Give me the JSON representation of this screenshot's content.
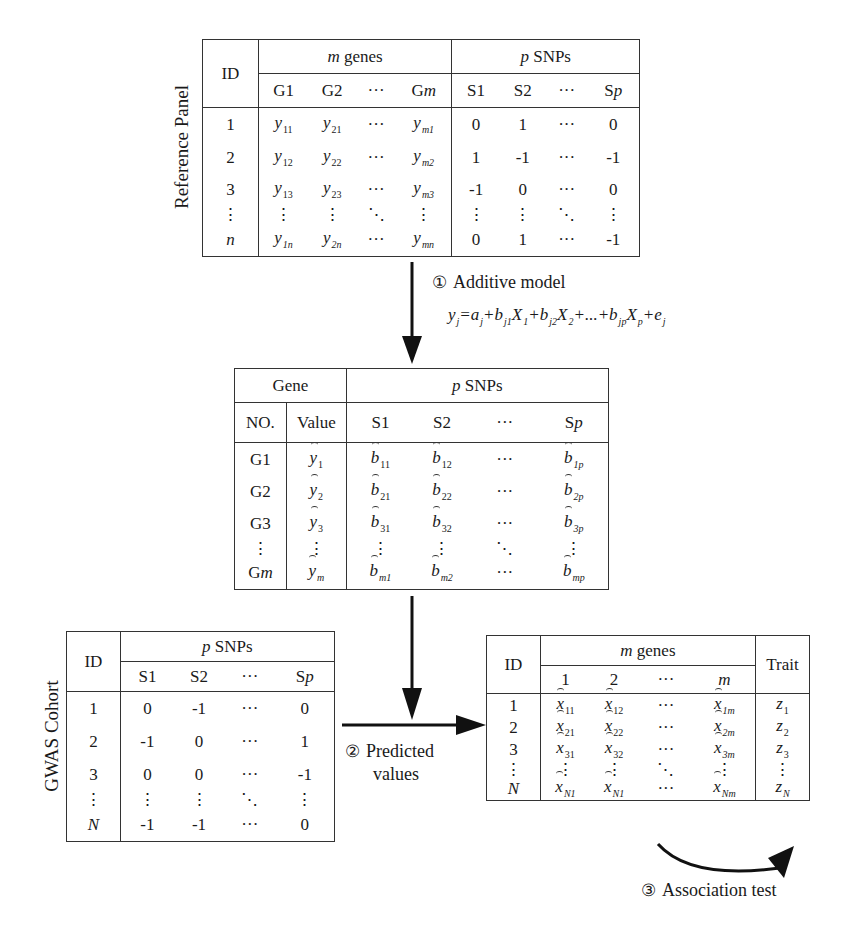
{
  "reference_panel": {
    "side_label": "Reference Panel",
    "id_header": "ID",
    "genes_group": {
      "var": "m",
      "label": " genes"
    },
    "snps_group": {
      "var": "p",
      "label": " SNPs"
    },
    "gene_cols": [
      "G1",
      "G2",
      "···",
      "Gm"
    ],
    "snp_cols": [
      "S1",
      "S2",
      "···",
      "Sp"
    ],
    "rows": [
      {
        "id": "1",
        "genes": [
          [
            "y",
            "11"
          ],
          [
            "y",
            "21"
          ],
          [
            "···",
            ""
          ],
          [
            "y",
            "m1"
          ]
        ],
        "snps": [
          "0",
          "1",
          "···",
          "0"
        ]
      },
      {
        "id": "2",
        "genes": [
          [
            "y",
            "12"
          ],
          [
            "y",
            "22"
          ],
          [
            "···",
            ""
          ],
          [
            "y",
            "m2"
          ]
        ],
        "snps": [
          "1",
          "-1",
          "···",
          "-1"
        ]
      },
      {
        "id": "3",
        "genes": [
          [
            "y",
            "13"
          ],
          [
            "y",
            "23"
          ],
          [
            "···",
            ""
          ],
          [
            "y",
            "m3"
          ]
        ],
        "snps": [
          "-1",
          "0",
          "···",
          "0"
        ]
      },
      {
        "id": "⋮",
        "genes": [
          [
            "⋮",
            ""
          ],
          [
            "⋮",
            ""
          ],
          [
            "⋱",
            ""
          ],
          [
            "⋮",
            ""
          ]
        ],
        "snps": [
          "⋮",
          "⋮",
          "⋱",
          "⋮"
        ]
      },
      {
        "id": "n",
        "genes": [
          [
            "y",
            "1n"
          ],
          [
            "y",
            "2n"
          ],
          [
            "···",
            ""
          ],
          [
            "y",
            "mn"
          ]
        ],
        "snps": [
          "0",
          "1",
          "···",
          "-1"
        ]
      }
    ]
  },
  "step1": {
    "marker": "①",
    "label": "Additive model",
    "formula": "y_j=a_j+b_j1 X_1+b_j2 X_2+...+b_jp X_p+e_j"
  },
  "weights_table": {
    "gene_header": "Gene",
    "snps_group": {
      "var": "p",
      "label": " SNPs"
    },
    "no_header": "NO.",
    "value_header": "Value",
    "snp_cols": [
      "S1",
      "S2",
      "···",
      "Sp"
    ],
    "rows": [
      {
        "no": "G1",
        "value_sub": "1",
        "b": [
          "11",
          "12",
          "···",
          "1p"
        ]
      },
      {
        "no": "G2",
        "value_sub": "2",
        "b": [
          "21",
          "22",
          "···",
          "2p"
        ]
      },
      {
        "no": "G3",
        "value_sub": "3",
        "b": [
          "31",
          "32",
          "···",
          "3p"
        ]
      },
      {
        "no": "⋮",
        "value_sub": "⋮",
        "b": [
          "⋮",
          "⋮",
          "⋱",
          "⋮"
        ]
      },
      {
        "no": "Gm",
        "value_sub": "m",
        "b": [
          "m1",
          "m2",
          "···",
          "mp"
        ]
      }
    ]
  },
  "gwas_cohort": {
    "side_label": "GWAS Cohort",
    "id_header": "ID",
    "snps_group": {
      "var": "p",
      "label": " SNPs"
    },
    "snp_cols": [
      "S1",
      "S2",
      "···",
      "Sp"
    ],
    "rows": [
      {
        "id": "1",
        "snps": [
          "0",
          "-1",
          "···",
          "0"
        ]
      },
      {
        "id": "2",
        "snps": [
          "-1",
          "0",
          "···",
          "1"
        ]
      },
      {
        "id": "3",
        "snps": [
          "0",
          "0",
          "···",
          "-1"
        ]
      },
      {
        "id": "⋮",
        "snps": [
          "⋮",
          "⋮",
          "⋱",
          "⋮"
        ]
      },
      {
        "id": "N",
        "snps": [
          "-1",
          "-1",
          "···",
          "0"
        ]
      }
    ]
  },
  "step2": {
    "marker": "②",
    "line1": "Predicted",
    "line2": "values"
  },
  "predicted_table": {
    "id_header": "ID",
    "genes_group": {
      "var": "m",
      "label": " genes"
    },
    "gene_cols": [
      "1",
      "2",
      "···",
      "m"
    ],
    "trait_header": "Trait",
    "rows": [
      {
        "id": "1",
        "x": [
          "11",
          "12",
          "···",
          "1m"
        ],
        "z": "1"
      },
      {
        "id": "2",
        "x": [
          "21",
          "22",
          "···",
          "2m"
        ],
        "z": "2"
      },
      {
        "id": "3",
        "x": [
          "31",
          "32",
          "···",
          "3m"
        ],
        "z": "3"
      },
      {
        "id": "⋮",
        "x": [
          "⋮",
          "⋮",
          "⋱",
          "⋮"
        ],
        "z": "⋮"
      },
      {
        "id": "N",
        "x": [
          "N1",
          "N1",
          "···",
          "Nm"
        ],
        "z": "N"
      }
    ]
  },
  "step3": {
    "marker": "③",
    "label": "Association test"
  }
}
